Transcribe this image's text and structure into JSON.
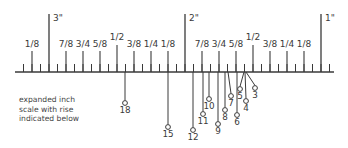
{
  "figure": {
    "caption_lines": [
      "expanded inch",
      "scale with rise",
      "indicated below"
    ],
    "colors": {
      "ink": "#3a3a3a",
      "background": "#ffffff"
    }
  },
  "ruler": {
    "baseline_y": 72,
    "x_start": 15,
    "x_end": 334,
    "sixteenth_px": 8.5,
    "inch_marks": [
      {
        "label": "3\"",
        "x": 49
      },
      {
        "label": "2\"",
        "x": 185
      },
      {
        "label": "1\"",
        "x": 321
      }
    ],
    "fraction_marks": [
      {
        "label": "1/8",
        "x": 32
      },
      {
        "label": "7/8",
        "x": 66
      },
      {
        "label": "3/4",
        "x": 83
      },
      {
        "label": "5/8",
        "x": 100
      },
      {
        "label": "1/2",
        "x": 117
      },
      {
        "label": "3/8",
        "x": 134
      },
      {
        "label": "1/4",
        "x": 151
      },
      {
        "label": "1/8",
        "x": 168
      },
      {
        "label": "7/8",
        "x": 202
      },
      {
        "label": "3/4",
        "x": 219
      },
      {
        "label": "5/8",
        "x": 236
      },
      {
        "label": "1/2",
        "x": 253
      },
      {
        "label": "3/8",
        "x": 270
      },
      {
        "label": "1/4",
        "x": 287
      },
      {
        "label": "1/8",
        "x": 304
      }
    ]
  },
  "pointers": [
    {
      "label": "18",
      "x_top": 125,
      "x_end": 125,
      "y_end": 103
    },
    {
      "label": "15",
      "x_top": 168,
      "x_end": 168,
      "y_end": 127
    },
    {
      "label": "12",
      "x_top": 193,
      "x_end": 193,
      "y_end": 130
    },
    {
      "label": "11",
      "x_top": 203,
      "x_end": 203,
      "y_end": 114
    },
    {
      "label": "10",
      "x_top": 209,
      "x_end": 209,
      "y_end": 99
    },
    {
      "label": "9",
      "x_top": 218,
      "x_end": 218,
      "y_end": 124
    },
    {
      "label": "8",
      "x_top": 225,
      "x_end": 225,
      "y_end": 110
    },
    {
      "label": "7",
      "x_top": 228,
      "x_end": 231,
      "y_end": 96
    },
    {
      "label": "6",
      "x_top": 237,
      "x_end": 237,
      "y_end": 115
    },
    {
      "label": "5",
      "x_top": 244,
      "x_end": 240,
      "y_end": 89
    },
    {
      "label": "4",
      "x_top": 245,
      "x_end": 246,
      "y_end": 101
    },
    {
      "label": "3",
      "x_top": 246,
      "x_end": 255,
      "y_end": 88
    }
  ]
}
